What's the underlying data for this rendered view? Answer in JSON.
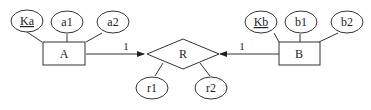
{
  "diagram": {
    "type": "ER diagram",
    "entities": [
      {
        "id": "A",
        "label": "A",
        "attributes": [
          {
            "label": "Ka",
            "key": true
          },
          {
            "label": "a1",
            "key": false
          },
          {
            "label": "a2",
            "key": false
          }
        ]
      },
      {
        "id": "B",
        "label": "B",
        "attributes": [
          {
            "label": "Kb",
            "key": true
          },
          {
            "label": "b1",
            "key": false
          },
          {
            "label": "b2",
            "key": false
          }
        ]
      }
    ],
    "relationship": {
      "label": "R",
      "attributes": [
        {
          "label": "r1"
        },
        {
          "label": "r2"
        }
      ]
    },
    "cardinalities": {
      "A_R": "1",
      "B_R": "1"
    },
    "colors": {
      "stroke": "#333333",
      "background": "#ffffff"
    }
  }
}
